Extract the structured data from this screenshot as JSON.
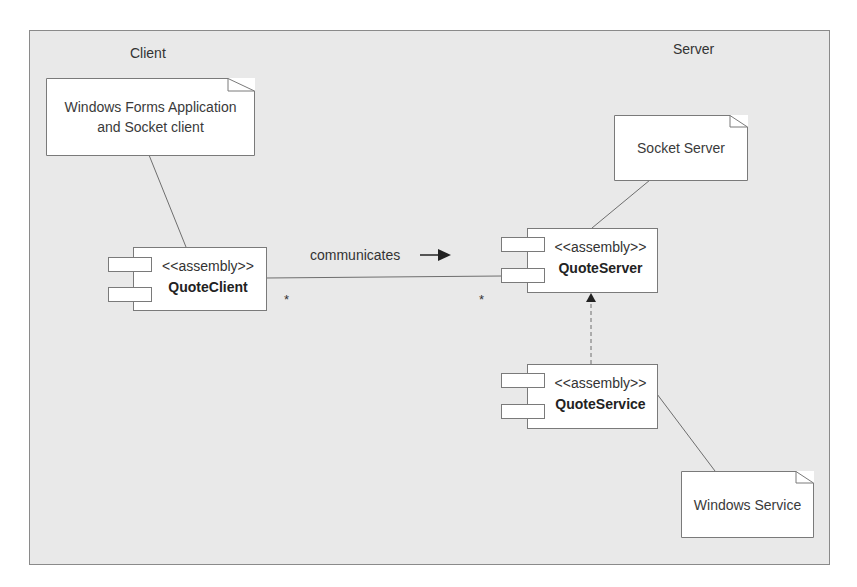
{
  "diagram": {
    "type": "UML component diagram",
    "regions": {
      "client": {
        "label": "Client"
      },
      "server": {
        "label": "Server"
      }
    },
    "notes": [
      {
        "id": "client-note",
        "lines": [
          "Windows Forms Application",
          "and Socket client"
        ]
      },
      {
        "id": "socket-server-note",
        "lines": [
          "Socket Server"
        ]
      },
      {
        "id": "windows-service-note",
        "lines": [
          "Windows Service"
        ]
      }
    ],
    "components": [
      {
        "id": "quote-client",
        "stereotype": "<<assembly>>",
        "name": "QuoteClient"
      },
      {
        "id": "quote-server",
        "stereotype": "<<assembly>>",
        "name": "QuoteServer"
      },
      {
        "id": "quote-service",
        "stereotype": "<<assembly>>",
        "name": "QuoteService"
      }
    ],
    "association": {
      "label": "communicates",
      "from": "QuoteClient",
      "to": "QuoteServer",
      "from_multiplicity": "*",
      "to_multiplicity": "*"
    },
    "dependency": {
      "from": "QuoteService",
      "to": "QuoteServer",
      "style": "dashed"
    },
    "colors": {
      "background": "#e9e9e9",
      "frame_border": "#8a8a8a",
      "box_fill": "#ffffff",
      "line": "#6e6e6e"
    }
  }
}
